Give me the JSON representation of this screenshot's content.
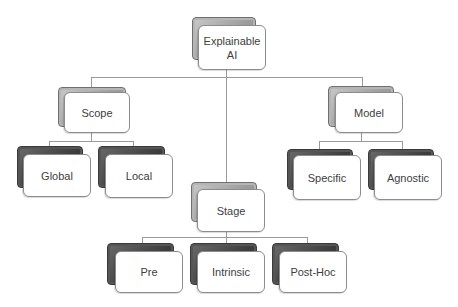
{
  "diagram": {
    "type": "hierarchy",
    "root": {
      "label": "Explainable AI",
      "label_lines": [
        "Explainable",
        "AI"
      ]
    },
    "categories": {
      "scope": {
        "label": "Scope",
        "children": [
          {
            "label": "Global"
          },
          {
            "label": "Local"
          }
        ]
      },
      "stage": {
        "label": "Stage",
        "children": [
          {
            "label": "Pre"
          },
          {
            "label": "Intrinsic"
          },
          {
            "label": "Post-Hoc"
          }
        ]
      },
      "model": {
        "label": "Model",
        "children": [
          {
            "label": "Specific"
          },
          {
            "label": "Agnostic"
          }
        ]
      }
    },
    "colors": {
      "connector": "#9a9a9a",
      "card_front": "#ffffff",
      "card_back_light": "#a8a8a8",
      "card_back_dark": "#444444",
      "text": "#404040"
    }
  }
}
